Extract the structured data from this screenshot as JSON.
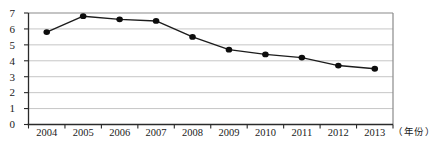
{
  "chart_data": {
    "type": "line",
    "categories": [
      "2004",
      "2005",
      "2006",
      "2007",
      "2008",
      "2009",
      "2010",
      "2011",
      "2012",
      "2013"
    ],
    "values": [
      5.8,
      6.8,
      6.6,
      6.5,
      5.5,
      4.7,
      4.4,
      4.2,
      3.7,
      3.5
    ],
    "title": "",
    "xlabel": "（年份）",
    "ylabel": "",
    "ylim": [
      0,
      7
    ],
    "yticks": [
      0,
      1,
      2,
      3,
      4,
      5,
      6,
      7
    ],
    "grid": true,
    "legend_position": "none",
    "colors": {
      "line": "#1c1c1c",
      "marker": "#0d0d0d",
      "gridline": "#c6c6c6",
      "frame": "#8a8a8a",
      "axis": "#2a2a2a",
      "tick_label": "#1a1a1a"
    }
  }
}
